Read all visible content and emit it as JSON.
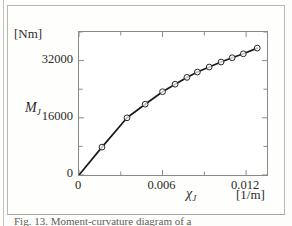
{
  "figure": {
    "caption": "Fig. 13.   Moment-curvature diagram of a"
  },
  "axes": {
    "y_unit": "[Nm]",
    "y_label": "M",
    "y_label_sub": "J",
    "x_label": "χ",
    "x_label_sub": "J",
    "x_unit": "[1/m]",
    "y_ticks": [
      "0",
      "16000",
      "32000"
    ],
    "x_ticks": [
      "0",
      "0.006",
      "0.012"
    ]
  },
  "colors": {
    "curve": "#1a1a1a",
    "marker_fill": "#ffffff",
    "marker_stroke": "#2a2a28",
    "frame": "#8a8a85",
    "page": "#fefefd",
    "border": "#b9b9b4"
  },
  "chart_data": {
    "type": "line",
    "title": "",
    "xlabel": "χ_J",
    "ylabel": "M_J",
    "x_unit": "1/m",
    "y_unit": "Nm",
    "xlim": [
      0,
      0.0135
    ],
    "ylim": [
      0,
      40000
    ],
    "x_major_ticks": [
      0,
      0.006,
      0.012
    ],
    "y_major_ticks": [
      0,
      16000,
      32000
    ],
    "x_minor_step": 0.003,
    "y_minor_step": 8000,
    "grid": false,
    "legend": null,
    "marker": "open-circle",
    "series": [
      {
        "name": "M_J vs chi_J",
        "x": [
          0.0,
          0.00165,
          0.00345,
          0.00475,
          0.006,
          0.0069,
          0.00775,
          0.0085,
          0.00935,
          0.0102,
          0.011,
          0.0118,
          0.0128
        ],
        "y": [
          0,
          7800,
          16000,
          19800,
          23300,
          25400,
          27300,
          28800,
          30200,
          31600,
          32800,
          33900,
          35500
        ]
      }
    ]
  }
}
